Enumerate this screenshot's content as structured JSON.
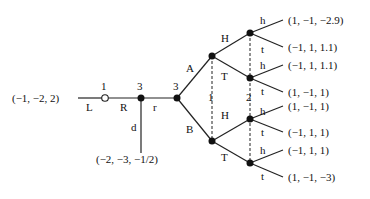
{
  "diagram": {
    "type": "extensive-form game tree",
    "nodes": {
      "root": {
        "player": "1",
        "style": "open"
      },
      "n2": {
        "player": "3"
      },
      "n3": {
        "player": "3"
      }
    },
    "actions": {
      "L": "L",
      "R": "R",
      "d": "d",
      "r": "r",
      "A": "A",
      "B": "B",
      "H_upper": "H",
      "T_upper": "T",
      "H_lower": "H",
      "T_lower": "T",
      "h1": "h",
      "t1": "t",
      "h2": "h",
      "t2": "t",
      "h3": "h",
      "t3": "t",
      "h4": "h",
      "t4": "t"
    },
    "info_sets": {
      "set1": "1",
      "set2": "2"
    },
    "payoffs": {
      "L": "(−1, −2, 2)",
      "d": "(−2, −3, −1/2)",
      "AHh": "(1, −1, −2.9)",
      "AHt": "(−1, 1, 1.1)",
      "ATh": "(−1, 1, 1.1)",
      "ATt": "(1, −1, 1)",
      "BHh": "(1, −1, 1)",
      "BHt": "(−1, 1, 1)",
      "BTh": "(−1, 1, 1)",
      "BTt": "(1, −1, −3)"
    }
  }
}
